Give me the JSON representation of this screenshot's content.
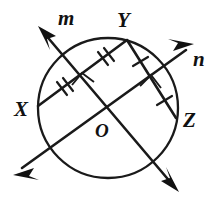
{
  "figure": {
    "background_color": "#ffffff",
    "ink_color": "#111111"
  },
  "circle": {
    "name": "circle-O",
    "center_label": "O",
    "center_x": 108,
    "center_y": 108,
    "radius": 70
  },
  "points": [
    {
      "id": "X",
      "label": "X",
      "x": 38,
      "y": 106,
      "label_x": 19,
      "label_y": 114,
      "position": "left"
    },
    {
      "id": "Y",
      "label": "Y",
      "x": 127,
      "y": 40,
      "label_x": 122,
      "label_y": 24,
      "position": "top"
    },
    {
      "id": "Z",
      "label": "Z",
      "x": 176,
      "y": 118,
      "label_x": 185,
      "label_y": 126,
      "position": "right"
    },
    {
      "id": "O",
      "label": "O",
      "x": 108,
      "y": 108,
      "label_x": 98,
      "label_y": 134,
      "position": "center"
    }
  ],
  "lines": [
    {
      "id": "m",
      "label": "m",
      "label_x": 64,
      "label_y": 21,
      "description": "secant line m, arrowheads upper-left and lower-right, passes through center O",
      "x1": 44,
      "y1": 33,
      "x2": 172,
      "y2": 184,
      "arrow_start": true,
      "arrow_end": true
    },
    {
      "id": "n",
      "label": "n",
      "label_x": 196,
      "label_y": 62,
      "description": "secant line n, arrowheads lower-left and upper-right, passes through center O",
      "x1": 22,
      "y1": 168,
      "x2": 186,
      "y2": 50,
      "arrow_start": true,
      "arrow_end": true
    }
  ],
  "chords": [
    {
      "id": "XY",
      "label": "chord XY",
      "x1": 38,
      "y1": 106,
      "x2": 127,
      "y2": 40,
      "tick_count": 2,
      "perpendicular_to": "n",
      "description": "chord from X to Y, bisected by line n at right angle, double tick marks on each half"
    },
    {
      "id": "YZ",
      "label": "chord YZ",
      "x1": 127,
      "y1": 40,
      "x2": 176,
      "y2": 118,
      "tick_count": 1,
      "perpendicular_to": "m",
      "description": "chord from Y to Z, bisected by line m at right angle, single tick mark on each half"
    }
  ],
  "congruence_marks": [
    {
      "id": "xy-left-ticks",
      "on_chord": "XY",
      "count": 2,
      "x": 62,
      "y": 88,
      "angle": -36
    },
    {
      "id": "xy-right-ticks",
      "on_chord": "XY",
      "count": 2,
      "x": 103,
      "y": 58,
      "angle": -36
    },
    {
      "id": "yz-upper-tick",
      "on_chord": "YZ",
      "count": 1,
      "x": 140,
      "y": 61,
      "angle": 58
    },
    {
      "id": "yz-lower-tick",
      "on_chord": "YZ",
      "count": 1,
      "x": 164,
      "y": 99,
      "angle": 58
    }
  ],
  "right_angle_marks": [
    {
      "id": "right-angle-at-xy",
      "at_chord": "XY",
      "crossing_line": "n",
      "x": 81,
      "y": 79,
      "size": 13
    },
    {
      "id": "right-angle-at-yz",
      "at_chord": "YZ",
      "crossing_line": "m",
      "x": 149,
      "y": 82,
      "size": 13
    }
  ],
  "legend": {
    "line_m": "m",
    "line_n": "n",
    "point_x": "X",
    "point_y": "Y",
    "point_z": "Z",
    "center": "O"
  }
}
